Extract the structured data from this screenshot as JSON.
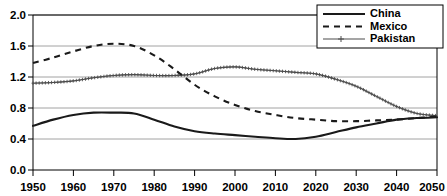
{
  "chart_data": {
    "type": "line",
    "title": "",
    "subtitle": "",
    "xlabel": "",
    "ylabel": "",
    "xlim": [
      1950,
      2050
    ],
    "ylim": [
      0.0,
      2.0
    ],
    "grid": true,
    "legend_position": "top-right",
    "y_ticks": [
      "0.0",
      "0.4",
      "0.8",
      "1.2",
      "1.6",
      "2.0"
    ],
    "y_tick_values": [
      0.0,
      0.4,
      0.8,
      1.2,
      1.6,
      2.0
    ],
    "x_ticks": [
      "1950",
      "1960",
      "1970",
      "1980",
      "1990",
      "2000",
      "2010",
      "2020",
      "2030",
      "2040",
      "2050"
    ],
    "x_tick_values": [
      1950,
      1960,
      1970,
      1980,
      1990,
      2000,
      2010,
      2020,
      2030,
      2040,
      2050
    ],
    "x": [
      1950,
      1955,
      1960,
      1965,
      1970,
      1975,
      1980,
      1985,
      1990,
      1995,
      2000,
      2005,
      2010,
      2015,
      2020,
      2025,
      2030,
      2035,
      2040,
      2045,
      2050
    ],
    "series": [
      {
        "name": "China",
        "style": "solid",
        "color": "#1a1a1a",
        "values": [
          0.57,
          0.65,
          0.71,
          0.74,
          0.74,
          0.73,
          0.65,
          0.56,
          0.5,
          0.47,
          0.45,
          0.43,
          0.41,
          0.4,
          0.43,
          0.49,
          0.55,
          0.6,
          0.65,
          0.67,
          0.68
        ]
      },
      {
        "name": "Mexico",
        "style": "dashed",
        "color": "#1a1a1a",
        "values": [
          1.38,
          1.45,
          1.53,
          1.6,
          1.63,
          1.6,
          1.48,
          1.3,
          1.1,
          0.95,
          0.84,
          0.76,
          0.71,
          0.67,
          0.65,
          0.63,
          0.63,
          0.64,
          0.65,
          0.67,
          0.69
        ]
      },
      {
        "name": "Pakistan",
        "style": "marker",
        "color": "#4d4d4d",
        "values": [
          1.12,
          1.13,
          1.15,
          1.19,
          1.22,
          1.23,
          1.22,
          1.22,
          1.24,
          1.31,
          1.33,
          1.3,
          1.28,
          1.26,
          1.24,
          1.17,
          1.08,
          0.95,
          0.82,
          0.73,
          0.7
        ]
      }
    ],
    "legend": [
      {
        "label": "China",
        "style": "solid"
      },
      {
        "label": "Mexico",
        "style": "dashed"
      },
      {
        "label": "Pakistan",
        "style": "marker"
      }
    ]
  }
}
